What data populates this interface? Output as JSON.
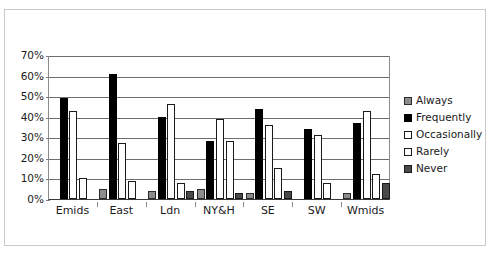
{
  "chart_data": {
    "type": "bar",
    "title": "",
    "subtitle": "",
    "xlabel": "",
    "ylabel": "",
    "ylim": [
      0,
      70
    ],
    "ytick_labels": [
      "0%",
      "10%",
      "20%",
      "30%",
      "40%",
      "50%",
      "60%",
      "70%"
    ],
    "ytick_values": [
      0,
      10,
      20,
      30,
      40,
      50,
      60,
      70
    ],
    "grid": true,
    "legend_position": "right",
    "categories": [
      "Emids",
      "East",
      "Ldn",
      "NY&H",
      "SE",
      "SW",
      "Wmids"
    ],
    "series": [
      {
        "name": "Always",
        "color": "#8c8c8c",
        "values": [
          0,
          5,
          4,
          5,
          3,
          0,
          3
        ]
      },
      {
        "name": "Frequently",
        "color": "#000000",
        "values": [
          49,
          61,
          40,
          28,
          44,
          34,
          37
        ]
      },
      {
        "name": "Occasionally",
        "color": "#ffffff",
        "values": [
          43,
          27,
          46,
          39,
          36,
          31,
          43
        ]
      },
      {
        "name": "Rarely",
        "color": "#ffffff",
        "values": [
          10,
          9,
          8,
          28,
          15,
          8,
          12
        ]
      },
      {
        "name": "Never",
        "color": "#4a4a4a",
        "values": [
          0,
          0,
          4,
          3,
          4,
          0,
          8
        ]
      }
    ]
  },
  "legend": {
    "items": [
      {
        "label": "Always",
        "swatch": "legend-swatch-always"
      },
      {
        "label": "Frequently",
        "swatch": "legend-swatch-frequently"
      },
      {
        "label": "Occasionally",
        "swatch": "legend-swatch-occasionally"
      },
      {
        "label": "Rarely",
        "swatch": "legend-swatch-rarely"
      },
      {
        "label": "Never",
        "swatch": "legend-swatch-never"
      }
    ]
  }
}
